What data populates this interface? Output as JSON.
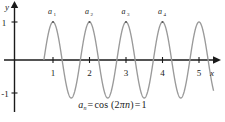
{
  "figure": {
    "name": "cosine-sequence-plot",
    "curve_color": "#9a9a9a",
    "axis_color": "#1a1a1a",
    "background": "#ffffff"
  },
  "axes": {
    "y_label": "y",
    "x_label": "x",
    "y_ticks": [
      {
        "value": 1,
        "label": "1"
      },
      {
        "value": -1,
        "label": "-1"
      }
    ],
    "x_ticks": [
      {
        "value": 1,
        "label": "1"
      },
      {
        "value": 2,
        "label": "2"
      },
      {
        "value": 3,
        "label": "3"
      },
      {
        "value": 4,
        "label": "4"
      },
      {
        "value": 5,
        "label": "5"
      }
    ]
  },
  "point_labels": [
    {
      "text": "a",
      "sub": "1",
      "x": 1,
      "y": 1
    },
    {
      "text": "a",
      "sub": "2",
      "x": 2,
      "y": 1
    },
    {
      "text": "a",
      "sub": "3",
      "x": 3,
      "y": 1
    },
    {
      "text": "a",
      "sub": "4",
      "x": 4,
      "y": 1
    }
  ],
  "formula": {
    "term": "a",
    "subscript": "n",
    "equals_1": "=",
    "function": "cos (2",
    "pi": "π",
    "variable": "n",
    "close": ")",
    "equals_2": "=",
    "result": "1",
    "plain": "a_n = cos (2πn) = 1"
  },
  "chart_data": {
    "type": "line",
    "title": "",
    "xlabel": "x",
    "ylabel": "y",
    "xlim": [
      -0.35,
      5.55
    ],
    "ylim": [
      -1.35,
      1.35
    ],
    "grid": false,
    "legend": null,
    "function": "y = cos(2πx)",
    "series": [
      {
        "name": "cos(2πx)",
        "color": "#9a9a9a",
        "x_start": 0.75,
        "x_end": 5.4,
        "period": 1,
        "amplitude": 1
      }
    ],
    "marked_points": [
      {
        "label": "a₁",
        "x": 1,
        "y": 1
      },
      {
        "label": "a₂",
        "x": 2,
        "y": 1
      },
      {
        "label": "a₃",
        "x": 3,
        "y": 1
      },
      {
        "label": "a₄",
        "x": 4,
        "y": 1
      }
    ],
    "annotations": [
      "a_n = cos (2πn) = 1"
    ]
  }
}
